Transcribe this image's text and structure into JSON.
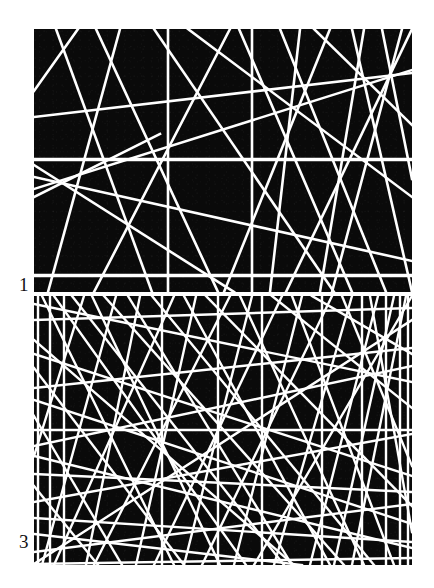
{
  "figure": {
    "background_color": "#ffffff",
    "field_color": "#0a0a0a",
    "line_color": "#ffffff",
    "panels": [
      {
        "id": "panel-1",
        "label": "1",
        "label_position": "bottom-left-outside",
        "intensity_note": "lower line density",
        "line_count": 28,
        "stroke_width": 2.6,
        "rect": {
          "x": 34,
          "y": 29,
          "w": 378,
          "h": 263
        }
      },
      {
        "id": "panel-3",
        "label": "3",
        "label_position": "bottom-left-outside",
        "intensity_note": "higher line density",
        "line_count": 60,
        "stroke_width": 2.4,
        "rect": {
          "x": 34,
          "y": 296,
          "w": 378,
          "h": 269
        }
      }
    ]
  },
  "chart_data": {
    "type": "scatter",
    "title": "",
    "xlabel": "",
    "ylabel": "",
    "grid": false,
    "legend": "none",
    "panels": [
      {
        "label": "1",
        "xlim": [
          0,
          378
        ],
        "ylim": [
          0,
          263
        ],
        "lines": [
          [
            0,
            62,
            44,
            0
          ],
          [
            0,
            88,
            378,
            44
          ],
          [
            0,
            136,
            200,
            263
          ],
          [
            0,
            168,
            126,
            105
          ],
          [
            0,
            148,
            378,
            232
          ],
          [
            0,
            160,
            378,
            41
          ],
          [
            22,
            0,
            118,
            263
          ],
          [
            62,
            0,
            184,
            263
          ],
          [
            86,
            0,
            14,
            263
          ],
          [
            120,
            0,
            300,
            263
          ],
          [
            134,
            0,
            134,
            263
          ],
          [
            154,
            0,
            378,
            168
          ],
          [
            196,
            0,
            60,
            263
          ],
          [
            205,
            0,
            318,
            263
          ],
          [
            218,
            0,
            218,
            263
          ],
          [
            246,
            0,
            352,
            263
          ],
          [
            266,
            0,
            236,
            263
          ],
          [
            280,
            0,
            378,
            96
          ],
          [
            296,
            0,
            190,
            263
          ],
          [
            318,
            0,
            378,
            263
          ],
          [
            330,
            0,
            286,
            263
          ],
          [
            348,
            0,
            378,
            150
          ],
          [
            368,
            0,
            298,
            263
          ],
          [
            378,
            0,
            252,
            263
          ],
          [
            0,
            130,
            378,
            130
          ],
          [
            0,
            131,
            378,
            131
          ],
          [
            0,
            246,
            378,
            246
          ],
          [
            0,
            247,
            378,
            247
          ]
        ]
      },
      {
        "label": "3",
        "xlim": [
          0,
          378
        ],
        "ylim": [
          0,
          269
        ],
        "lines": [
          [
            0,
            8,
            378,
            86
          ],
          [
            0,
            24,
            378,
            12
          ],
          [
            0,
            44,
            260,
            269
          ],
          [
            0,
            58,
            378,
            180
          ],
          [
            0,
            72,
            150,
            269
          ],
          [
            0,
            92,
            378,
            52
          ],
          [
            0,
            104,
            378,
            228
          ],
          [
            0,
            120,
            88,
            269
          ],
          [
            0,
            134,
            378,
            134
          ],
          [
            0,
            150,
            378,
            70
          ],
          [
            0,
            160,
            378,
            252
          ],
          [
            0,
            178,
            378,
            196
          ],
          [
            0,
            190,
            64,
            269
          ],
          [
            0,
            206,
            378,
            138
          ],
          [
            0,
            222,
            378,
            246
          ],
          [
            0,
            238,
            268,
            269
          ],
          [
            0,
            256,
            378,
            208
          ],
          [
            4,
            0,
            4,
            269
          ],
          [
            8,
            0,
            140,
            269
          ],
          [
            16,
            0,
            16,
            269
          ],
          [
            20,
            0,
            212,
            269
          ],
          [
            30,
            0,
            30,
            269
          ],
          [
            38,
            0,
            250,
            269
          ],
          [
            50,
            0,
            0,
            160
          ],
          [
            58,
            0,
            186,
            269
          ],
          [
            70,
            0,
            310,
            269
          ],
          [
            82,
            0,
            8,
            269
          ],
          [
            94,
            0,
            258,
            269
          ],
          [
            106,
            0,
            52,
            269
          ],
          [
            118,
            0,
            340,
            269
          ],
          [
            128,
            0,
            128,
            269
          ],
          [
            140,
            0,
            20,
            269
          ],
          [
            150,
            0,
            296,
            269
          ],
          [
            162,
            0,
            102,
            269
          ],
          [
            172,
            0,
            378,
            210
          ],
          [
            184,
            0,
            184,
            269
          ],
          [
            196,
            0,
            60,
            269
          ],
          [
            206,
            0,
            330,
            269
          ],
          [
            218,
            0,
            150,
            269
          ],
          [
            228,
            0,
            228,
            269
          ],
          [
            238,
            0,
            378,
            112
          ],
          [
            248,
            0,
            120,
            269
          ],
          [
            258,
            0,
            360,
            269
          ],
          [
            268,
            0,
            200,
            269
          ],
          [
            278,
            0,
            378,
            58
          ],
          [
            288,
            0,
            288,
            269
          ],
          [
            298,
            0,
            168,
            269
          ],
          [
            308,
            0,
            378,
            170
          ],
          [
            318,
            0,
            240,
            269
          ],
          [
            328,
            0,
            328,
            269
          ],
          [
            336,
            0,
            378,
            236
          ],
          [
            344,
            0,
            276,
            269
          ],
          [
            352,
            0,
            352,
            269
          ],
          [
            360,
            0,
            300,
            269
          ],
          [
            366,
            0,
            366,
            269
          ],
          [
            372,
            0,
            318,
            269
          ],
          [
            378,
            0,
            220,
            269
          ],
          [
            378,
            24,
            0,
            268
          ],
          [
            374,
            0,
            374,
            269
          ],
          [
            0,
            268,
            378,
            262
          ]
        ]
      }
    ]
  }
}
